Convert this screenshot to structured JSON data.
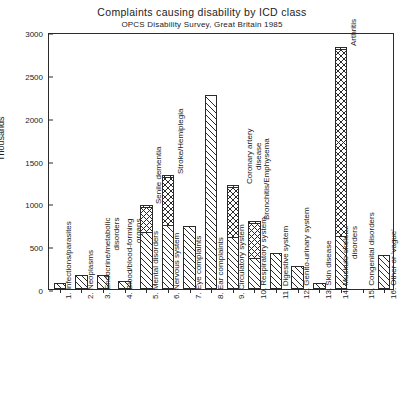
{
  "chart_data": {
    "type": "bar",
    "title": "Complaints causing disability by ICD class",
    "subtitle": "OPCS Disability Survey, Great Britain 1985",
    "xlabel": "",
    "ylabel": "Thousands",
    "ylim": [
      0,
      3000
    ],
    "yticks": [
      0,
      500,
      1000,
      1500,
      2000,
      2500,
      3000
    ],
    "ytick_labels": [
      "0",
      "500",
      "1000",
      "1500",
      "2000",
      "2500",
      "3000"
    ],
    "grid": false,
    "legend": "none",
    "categories": [
      "1. Infections/parasites",
      "2. Neoplasms",
      "3. Endocrine/metabolic disorders",
      "4. Blood/blood-forming organs",
      "5. Mental disorders",
      "6. Nervous system",
      "7. Eye complaints",
      "8. Ear complaints",
      "9. Circulatory system",
      "10. Respiratory system",
      "11. Genito-urinary system",
      "12. Digestive system",
      "13. Skin disease",
      "14. Muskulo-skeletal disorders",
      "15. Congenital disorders",
      "16. Other or 'vague'"
    ],
    "category_lines": [
      [
        "1. Infections/parasites"
      ],
      [
        "2. Neoplasms"
      ],
      [
        "3. Endocrine/metabolic",
        "disorders"
      ],
      [
        "4. Blood/blood-forming",
        "organs"
      ],
      [
        "5. Mental disorders"
      ],
      [
        "6. Nervous system"
      ],
      [
        "7. Eye complaints"
      ],
      [
        "8. Ear complaints"
      ],
      [
        "9. Circulatory system"
      ],
      [
        "10. Respiratory system"
      ],
      [
        "11. Digestive system"
      ],
      [
        "12. Genito-urinary system"
      ],
      [
        "13. Skin disease"
      ],
      [
        "14. Muskulo-skeletal",
        "disorders"
      ],
      [
        "15. Congenital disorders"
      ],
      [
        "16. Other or 'vague'"
      ]
    ],
    "values": [
      70,
      160,
      160,
      90,
      980,
      1330,
      740,
      2270,
      1215,
      790,
      420,
      265,
      70,
      2820,
      0,
      400
    ],
    "sub_segments": [
      {
        "category_index": 4,
        "label": "Senile dementia",
        "from": 680,
        "to": 980,
        "label_lines": [
          "Senile dementia"
        ]
      },
      {
        "category_index": 5,
        "label": "Stroke/Hemiplegia",
        "from": 760,
        "to": 1330,
        "label_lines": [
          "Stroke/Hemiplegia"
        ]
      },
      {
        "category_index": 8,
        "label": "Coronary artery disease",
        "from": 620,
        "to": 1215,
        "label_lines": [
          "Coronary artery",
          "disease"
        ]
      },
      {
        "category_index": 9,
        "label": "Bronchitis/Emphysema",
        "from": 370,
        "to": 790,
        "label_lines": [
          "Bronchitis/Emphysema"
        ]
      },
      {
        "category_index": 13,
        "label": "Arthritis",
        "from": 630,
        "to": 2820,
        "label_lines": [
          "Arthritis"
        ]
      }
    ]
  }
}
